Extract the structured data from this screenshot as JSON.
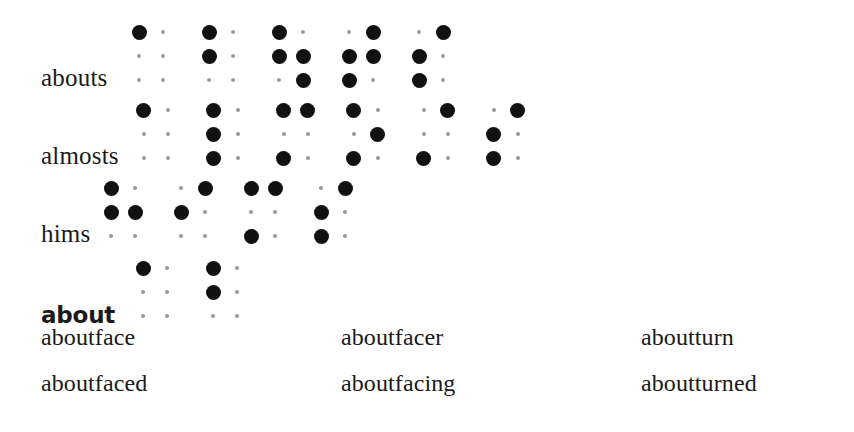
{
  "document": {
    "type": "braille-dictionary-entry",
    "background_color": "#ffffff",
    "text_color": "#1a1a1a",
    "dot_on_color": "#111111",
    "dot_off_color": "#9a9a9a"
  },
  "entries": [
    {
      "word": "abouts",
      "is_headword": false,
      "braille_cells": [
        {
          "letter": "a",
          "dots": [
            1
          ]
        },
        {
          "letter": "b",
          "dots": [
            1,
            2
          ]
        },
        {
          "letter": "ou",
          "dots": [
            1,
            2,
            5,
            6
          ]
        },
        {
          "letter": "t",
          "dots": [
            2,
            3,
            4,
            5
          ]
        },
        {
          "letter": "s",
          "dots": [
            2,
            3,
            4
          ]
        }
      ]
    },
    {
      "word": "almosts",
      "is_headword": false,
      "braille_cells": [
        {
          "letter": "a",
          "dots": [
            1
          ]
        },
        {
          "letter": "l",
          "dots": [
            1,
            2,
            3
          ]
        },
        {
          "letter": "m",
          "dots": [
            1,
            3,
            4
          ]
        },
        {
          "letter": "o",
          "dots": [
            1,
            3,
            5
          ]
        },
        {
          "letter": "st",
          "dots": [
            3,
            4
          ]
        },
        {
          "letter": "s",
          "dots": [
            2,
            3,
            4
          ]
        }
      ]
    },
    {
      "word": "hims",
      "is_headword": false,
      "braille_cells": [
        {
          "letter": "h",
          "dots": [
            1,
            2,
            5
          ]
        },
        {
          "letter": "i",
          "dots": [
            2,
            4
          ]
        },
        {
          "letter": "m",
          "dots": [
            1,
            3,
            4
          ]
        },
        {
          "letter": "s",
          "dots": [
            2,
            3,
            4
          ]
        }
      ]
    },
    {
      "word": "about",
      "is_headword": true,
      "braille_cells": [
        {
          "letter": "a",
          "dots": [
            1
          ]
        },
        {
          "letter": "b",
          "dots": [
            1,
            2
          ]
        }
      ]
    }
  ],
  "wordlist": {
    "columns": 3,
    "rows": [
      [
        "aboutface",
        "aboutfacer",
        "aboutturn"
      ],
      [
        "aboutfaced",
        "aboutfacing",
        "aboutturned"
      ]
    ]
  }
}
